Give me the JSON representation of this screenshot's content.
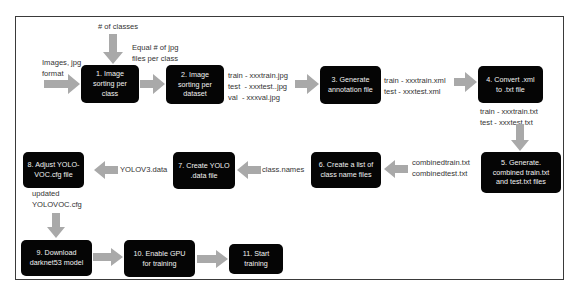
{
  "diagram": {
    "type": "flowchart",
    "arrow_color": "#a9a9a9",
    "box_color": "#050505",
    "box_text_color": "#f2f2f2",
    "steps": [
      {
        "id": 1,
        "label": "1. Image\nsorting per\nclass"
      },
      {
        "id": 2,
        "label": "2. Image\nsorting per\ndataset"
      },
      {
        "id": 3,
        "label": "3. Generate\nannotation file"
      },
      {
        "id": 4,
        "label": "4. Convert .xml\nto .txt file"
      },
      {
        "id": 5,
        "label": "5. Generate.\ncombined train.txt\nand test.txt files"
      },
      {
        "id": 6,
        "label": "6. Create a list of\nclass name files"
      },
      {
        "id": 7,
        "label": "7. Create YOLO\n.data file"
      },
      {
        "id": 8,
        "label": "8. Adjust YOLO-\nVOC.cfg file"
      },
      {
        "id": 9,
        "label": "9. Download\ndarknet53 model"
      },
      {
        "id": 10,
        "label": "10. Enable GPU\nfor training"
      },
      {
        "id": 11,
        "label": "11. Start\ntraining"
      }
    ],
    "annotations": {
      "classes_input": "# of classes",
      "images_input": "Images, jpg\nformat",
      "step1_output": "Equal # of jpg\nfiles per class",
      "step2_output": "train - xxxtrain.jpg\ntest  - xxxtest..jpg\nval  - xxxval.jpg",
      "step3_output": "train - xxxtrain.xml\ntest - xxxtest.xml",
      "step4_output": "train - xxxtrain.txt\ntest - xxxtest.txt",
      "step5_output": "combinedtrain.txt\ncombinedtest.txt",
      "step6_output": "class.names",
      "step7_output": "YOLOV3.data",
      "step8_output": "updated\nYOLOVOC.cfg"
    }
  }
}
